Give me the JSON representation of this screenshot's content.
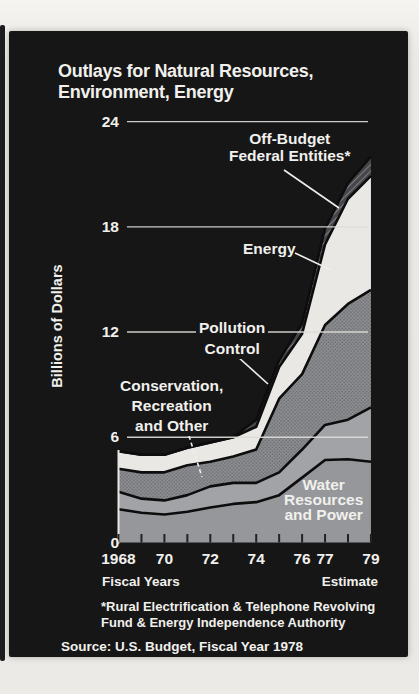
{
  "title": {
    "line1": "Outlays for Natural Resources,",
    "line2": "Environment, Energy"
  },
  "y_axis": {
    "title": "Billions of Dollars",
    "tick_labels": [
      "24",
      "18",
      "12",
      "6",
      "0"
    ]
  },
  "x_axis": {
    "tick_labels": [
      "1968",
      "70",
      "72",
      "74",
      "76",
      "77",
      "79"
    ],
    "left_caption": "Fiscal Years",
    "right_caption": "Estimate"
  },
  "callouts": [
    {
      "id": "off-budget",
      "lines": [
        "Off-Budget",
        "Federal Entities*"
      ]
    },
    {
      "id": "energy",
      "lines": [
        "Energy"
      ]
    },
    {
      "id": "pollution",
      "lines": [
        "Pollution",
        "Control"
      ]
    },
    {
      "id": "conservation",
      "lines": [
        "Conservation,",
        "Recreation",
        "and Other"
      ]
    },
    {
      "id": "water",
      "lines": [
        "Water",
        "Resources",
        "and Power"
      ]
    }
  ],
  "footnote": {
    "line1": "*Rural Electrification & Telephone Revolving",
    "line2": "Fund & Energy Independence Authority"
  },
  "source": "Source: U.S. Budget, Fiscal Year 1978",
  "colors": {
    "page": "#e9e7e3",
    "panel": "#161617",
    "text": "#f1f0ec",
    "gridline": "#dddcd8",
    "boundary": "#0d0d0e",
    "water": "#96979b",
    "conservation": "#a2a3a7",
    "pollution": "#8d8e92",
    "pollution_dot": "#616165",
    "energy": "#e9e8e4",
    "off_budget": "#47474b",
    "off_budget_hatch": "#a8a8aa"
  },
  "chart_data": {
    "type": "area",
    "stacked": true,
    "title": "Outlays for Natural Resources, Environment, Energy",
    "ylabel": "Billions of Dollars",
    "xlabel": "Fiscal Years",
    "x": [
      1968,
      1969,
      1970,
      1971,
      1972,
      1973,
      1974,
      1975,
      1976,
      1977,
      1978,
      1979
    ],
    "x_tick_years": [
      1968,
      1970,
      1972,
      1974,
      1976,
      1977,
      1979
    ],
    "ylim": [
      0,
      24
    ],
    "y_ticks": [
      0,
      6,
      12,
      18,
      24
    ],
    "grid": true,
    "legend_position": "callouts-on-chart",
    "units": "billions of dollars",
    "estimate_years": [
      1978,
      1979
    ],
    "series": [
      {
        "name": "Water Resources and Power",
        "pattern": "solid",
        "values": [
          1.9,
          1.7,
          1.6,
          1.75,
          2.0,
          2.2,
          2.3,
          2.7,
          3.7,
          4.7,
          4.75,
          4.6
        ]
      },
      {
        "name": "Conservation, Recreation and Other",
        "pattern": "solid",
        "values": [
          1.0,
          0.8,
          0.8,
          0.95,
          1.2,
          1.2,
          1.1,
          1.3,
          1.6,
          2.0,
          2.25,
          3.1
        ]
      },
      {
        "name": "Pollution Control",
        "pattern": "stipple",
        "values": [
          1.3,
          1.5,
          1.6,
          1.7,
          1.4,
          1.5,
          1.9,
          4.2,
          4.3,
          5.7,
          6.6,
          6.7
        ]
      },
      {
        "name": "Energy",
        "pattern": "solid",
        "values": [
          1.0,
          1.0,
          1.0,
          1.0,
          1.1,
          1.1,
          1.3,
          1.8,
          2.3,
          4.6,
          6.0,
          6.5
        ]
      },
      {
        "name": "Off-Budget Federal Entities",
        "pattern": "hatch",
        "values": [
          0,
          0,
          0,
          0,
          0,
          0,
          0.4,
          0.4,
          0.6,
          0.9,
          0.9,
          1.1
        ]
      }
    ]
  }
}
